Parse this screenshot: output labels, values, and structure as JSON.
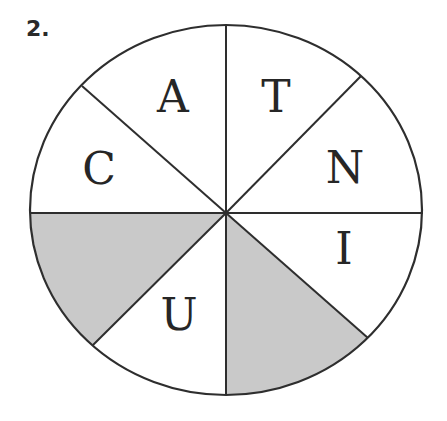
{
  "problem_number": "2.",
  "diagram": {
    "type": "letter-wheel",
    "center": {
      "x": 226,
      "y": 213
    },
    "radius": {
      "rx": 196,
      "ry": 185
    },
    "stroke_color": "#2e2e2e",
    "shade_color": "#c9c9c9",
    "segments": [
      {
        "id": "top-left",
        "letter": "A",
        "shaded": false
      },
      {
        "id": "top-right",
        "letter": "T",
        "shaded": false
      },
      {
        "id": "right-upper",
        "letter": "N",
        "shaded": false
      },
      {
        "id": "right-lower",
        "letter": "I",
        "shaded": false
      },
      {
        "id": "bottom-right",
        "letter": "",
        "shaded": true
      },
      {
        "id": "bottom-left",
        "letter": "U",
        "shaded": false
      },
      {
        "id": "left-lower",
        "letter": "",
        "shaded": true
      },
      {
        "id": "left-upper",
        "letter": "C",
        "shaded": false
      }
    ],
    "letters": {
      "A": "A",
      "T": "T",
      "N": "N",
      "I": "I",
      "U": "U",
      "C": "C"
    }
  }
}
